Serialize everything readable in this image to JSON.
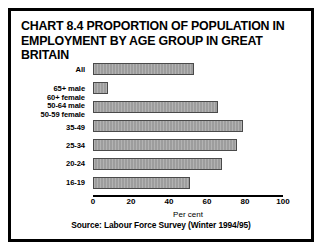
{
  "chart_data": {
    "type": "bar",
    "orientation": "horizontal",
    "title": "CHART 8.4 PROPORTION OF POPULATION IN EMPLOYMENT BY AGE GROUP IN GREAT BRITAIN",
    "title_lines": [
      "CHART 8.4 PROPORTION OF POPULATION IN",
      "EMPLOYMENT BY AGE GROUP IN GREAT BRITAIN"
    ],
    "categories": [
      "All",
      "65+ male\n60+ female",
      "50-64 male\n50-59 female",
      "35-49",
      "25-34",
      "20-24",
      "16-19"
    ],
    "category_lines": [
      [
        "All"
      ],
      [
        "65+ male",
        "60+ female"
      ],
      [
        "50-64 male",
        "50-59 female"
      ],
      [
        "35-49"
      ],
      [
        "25-34"
      ],
      [
        "20-24"
      ],
      [
        "16-19"
      ]
    ],
    "values": [
      53,
      8,
      66,
      79,
      76,
      68,
      51
    ],
    "xlabel": "Per cent",
    "ylabel": "",
    "xlim": [
      0,
      100
    ],
    "xticks": [
      0,
      20,
      40,
      60,
      80,
      100
    ],
    "xtick_labels": [
      "0",
      "20",
      "40",
      "60",
      "80",
      "100"
    ],
    "grid": false,
    "legend": false,
    "bar_color": "#9d9d9d",
    "bar_edge_color": "#4a4a4a",
    "axis_color": "#000000",
    "border_color": "#000000",
    "background_color": "#ffffff"
  },
  "source": {
    "text": "Source: Labour Force Survey (Winter 1994/95)"
  }
}
